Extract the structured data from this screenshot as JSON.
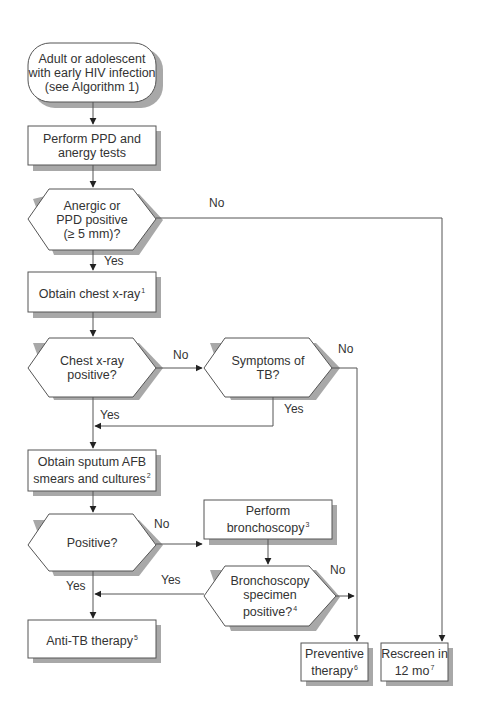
{
  "diagram": {
    "colors": {
      "line": "#555555",
      "shadow": "#9a9a9a",
      "fill": "#ffffff",
      "text": "#333333"
    },
    "nodes": {
      "start": {
        "line1": "Adult or adolescent",
        "line2": "with early HIV infection",
        "line3": "(see Algorithm 1)"
      },
      "ppd_tests": {
        "line1": "Perform PPD and",
        "line2": "anergy tests"
      },
      "anergic_decision": {
        "line1": "Anergic or",
        "line2": "PPD positive",
        "line3": "(≥ 5 mm)?"
      },
      "chest_xray": {
        "text": "Obtain chest x-ray",
        "footnote": "1"
      },
      "chest_xray_decision": {
        "line1": "Chest x-ray",
        "line2": "positive?"
      },
      "symptoms_decision": {
        "line1": "Symptoms of",
        "line2": "TB?"
      },
      "sputum": {
        "line1": "Obtain sputum AFB",
        "line2": "smears and cultures",
        "footnote": "2"
      },
      "positive_decision": {
        "text": "Positive?"
      },
      "bronchoscopy": {
        "line1": "Perform",
        "line2": "bronchoscopy",
        "footnote": "3"
      },
      "bronch_decision": {
        "line1": "Bronchoscopy",
        "line2": "specimen",
        "line3": "positive?",
        "footnote": "4"
      },
      "anti_tb": {
        "text": "Anti-TB therapy",
        "footnote": "5"
      },
      "preventive": {
        "line1": "Preventive",
        "line2": "therapy",
        "footnote": "6"
      },
      "rescreen": {
        "line1": "Rescreen in",
        "line2": "12 mo",
        "footnote": "7"
      }
    },
    "edge_labels": {
      "anergic_no": "No",
      "anergic_yes": "Yes",
      "xray_no": "No",
      "xray_yes": "Yes",
      "symptoms_no": "No",
      "symptoms_yes": "Yes",
      "positive_no": "No",
      "positive_yes": "Yes",
      "bronch_yes": "Yes",
      "bronch_no": "No"
    }
  }
}
